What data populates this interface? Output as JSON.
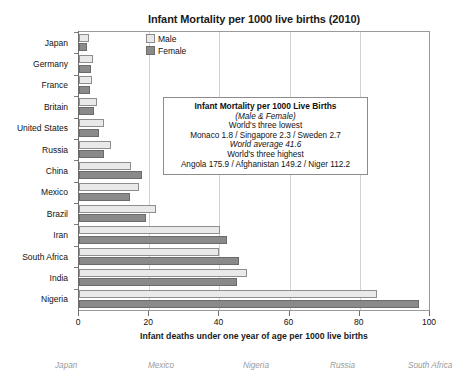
{
  "chart_data": {
    "type": "bar",
    "orientation": "horizontal",
    "title": "Infant Mortality per 1000 live births (2010)",
    "xlabel": "Infant deaths under one year of age per 1000 live births",
    "ylabel": "",
    "xlim": [
      0,
      100
    ],
    "xticks": [
      0,
      20,
      40,
      60,
      80,
      100
    ],
    "grid": true,
    "legend_position": "top-left-inside",
    "categories": [
      "Japan",
      "Germany",
      "France",
      "Britain",
      "United States",
      "Russia",
      "China",
      "Mexico",
      "Brazil",
      "Iran",
      "South Africa",
      "India",
      "Nigeria"
    ],
    "series": [
      {
        "name": "Male",
        "color": "#e9e9e9",
        "values": [
          2.8,
          4.1,
          3.6,
          5.2,
          7.1,
          9.2,
          14.8,
          17.2,
          22.0,
          40.2,
          40.0,
          48.0,
          85.0
        ]
      },
      {
        "name": "Female",
        "color": "#8a8a8a",
        "values": [
          2.4,
          3.3,
          3.0,
          4.4,
          5.8,
          7.0,
          18.0,
          14.4,
          19.0,
          42.2,
          45.5,
          45.0,
          97.0
        ]
      }
    ]
  },
  "legend": {
    "items": [
      {
        "label": "Male",
        "swatch": "male"
      },
      {
        "label": "Female",
        "swatch": "female"
      }
    ]
  },
  "infobox": {
    "lines": [
      {
        "text": "Infant Mortality per 1000 Live Births",
        "style": "bold"
      },
      {
        "text": "(Male & Female)",
        "style": "ital"
      },
      {
        "text": "World's three lowest",
        "style": "plain"
      },
      {
        "text": "Monaco 1.8 / Singapore 2.3 / Sweden 2.7",
        "style": "plain"
      },
      {
        "text": "World average 41.6",
        "style": "ital"
      },
      {
        "text": "World's three highest",
        "style": "plain"
      },
      {
        "text": "Angola 175.9 / Afghanistan 149.2 / Niger 112.2",
        "style": "plain"
      }
    ]
  },
  "bottom_caption": {
    "items": [
      {
        "label": "Japan",
        "left": 55
      },
      {
        "label": "Mexico",
        "left": 148
      },
      {
        "label": "Nigeria",
        "left": 243
      },
      {
        "label": "Russia",
        "left": 330
      },
      {
        "label": "South Africa",
        "left": 408
      }
    ]
  },
  "colors": {
    "male": "#e9e9e9",
    "female": "#8a8a8a",
    "frame": "#9a9a9a",
    "grid": "#d2d2d2"
  }
}
